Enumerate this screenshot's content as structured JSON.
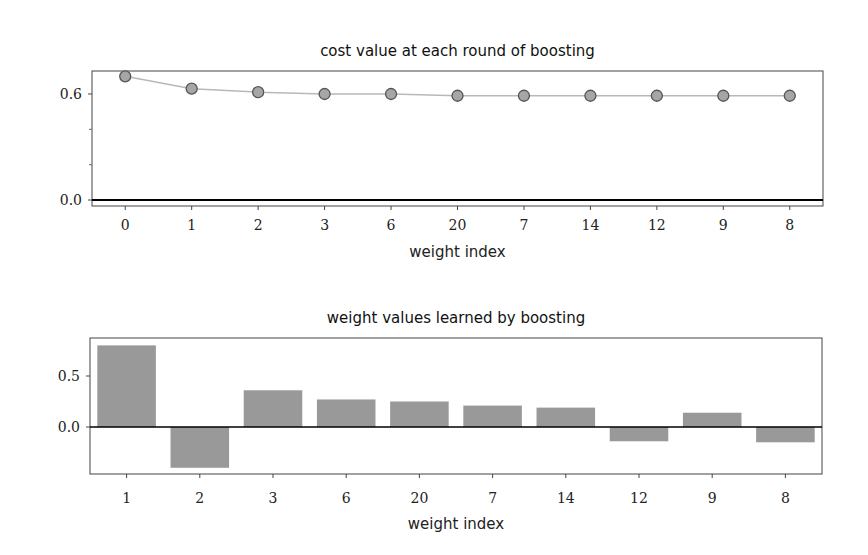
{
  "chart_data": [
    {
      "type": "line",
      "title": "cost value at each round of boosting",
      "xlabel": "weight index",
      "ylabel": "",
      "categories": [
        "0",
        "1",
        "2",
        "3",
        "6",
        "20",
        "7",
        "14",
        "12",
        "9",
        "8"
      ],
      "values": [
        0.7,
        0.63,
        0.61,
        0.6,
        0.6,
        0.59,
        0.59,
        0.59,
        0.59,
        0.59,
        0.59
      ],
      "ylim": [
        -0.02,
        0.72
      ],
      "yticks": [
        0.0,
        0.6
      ],
      "ytick_labels": [
        "0.0",
        "0.6"
      ],
      "grid": false,
      "marker": "circle",
      "colors": {
        "line": "#b8b8b8",
        "marker_fill": "#a6a6a6",
        "marker_edge": "#555555",
        "zero_line": "#000000"
      }
    },
    {
      "type": "bar",
      "title": "weight values learned by boosting",
      "xlabel": "weight index",
      "ylabel": "",
      "categories": [
        "1",
        "2",
        "3",
        "6",
        "20",
        "7",
        "14",
        "12",
        "9",
        "8"
      ],
      "values": [
        0.8,
        -0.4,
        0.36,
        0.27,
        0.25,
        0.21,
        0.19,
        -0.14,
        0.14,
        -0.15
      ],
      "ylim": [
        -0.46,
        0.87
      ],
      "yticks": [
        0.0,
        0.5
      ],
      "ytick_labels": [
        "0.0",
        "0.5"
      ],
      "grid": false,
      "colors": {
        "bar": "#999999",
        "zero_line": "#000000"
      }
    }
  ]
}
